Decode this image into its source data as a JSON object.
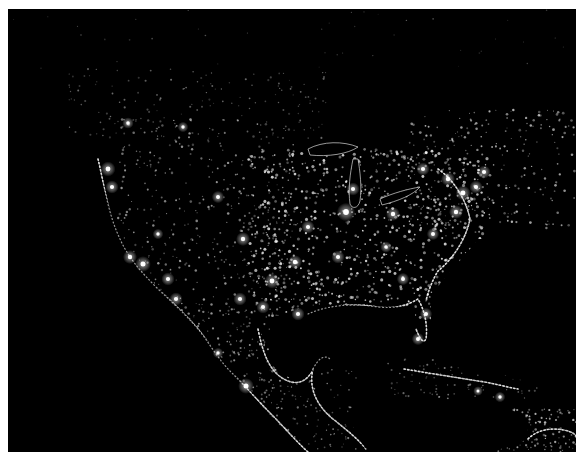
{
  "image": {
    "subject": "North America at night — satellite composite of city lights",
    "alt": "Night-time satellite view of North America showing city lights across the United States, southern Canada, Mexico, Central America and the Caribbean",
    "colors": {
      "background": "#000000",
      "frame": "#ffffff",
      "light": "#f4f4f4",
      "glow": "#bdbdbd"
    }
  },
  "scene": {
    "bright_cities": [
      {
        "x": 338,
        "y": 203,
        "r": 4.2
      },
      {
        "x": 345,
        "y": 180,
        "r": 3.0
      },
      {
        "x": 385,
        "y": 205,
        "r": 3.2
      },
      {
        "x": 300,
        "y": 218,
        "r": 3.0
      },
      {
        "x": 330,
        "y": 248,
        "r": 3.0
      },
      {
        "x": 287,
        "y": 253,
        "r": 3.2
      },
      {
        "x": 264,
        "y": 272,
        "r": 3.4
      },
      {
        "x": 290,
        "y": 305,
        "r": 3.0
      },
      {
        "x": 255,
        "y": 298,
        "r": 3.0
      },
      {
        "x": 232,
        "y": 290,
        "r": 3.0
      },
      {
        "x": 235,
        "y": 230,
        "r": 3.2
      },
      {
        "x": 210,
        "y": 188,
        "r": 2.8
      },
      {
        "x": 415,
        "y": 160,
        "r": 3.0
      },
      {
        "x": 440,
        "y": 170,
        "r": 3.2
      },
      {
        "x": 455,
        "y": 184,
        "r": 3.4
      },
      {
        "x": 448,
        "y": 203,
        "r": 3.2
      },
      {
        "x": 468,
        "y": 178,
        "r": 3.0
      },
      {
        "x": 476,
        "y": 163,
        "r": 3.0
      },
      {
        "x": 425,
        "y": 225,
        "r": 2.8
      },
      {
        "x": 378,
        "y": 238,
        "r": 2.6
      },
      {
        "x": 395,
        "y": 270,
        "r": 2.8
      },
      {
        "x": 150,
        "y": 225,
        "r": 2.4
      },
      {
        "x": 122,
        "y": 248,
        "r": 3.2
      },
      {
        "x": 135,
        "y": 255,
        "r": 3.6
      },
      {
        "x": 160,
        "y": 270,
        "r": 3.0
      },
      {
        "x": 168,
        "y": 290,
        "r": 3.0
      },
      {
        "x": 100,
        "y": 160,
        "r": 3.4
      },
      {
        "x": 104,
        "y": 178,
        "r": 3.0
      },
      {
        "x": 120,
        "y": 114,
        "r": 2.6
      },
      {
        "x": 175,
        "y": 118,
        "r": 2.4
      },
      {
        "x": 238,
        "y": 377,
        "r": 3.6
      },
      {
        "x": 210,
        "y": 344,
        "r": 2.4
      },
      {
        "x": 418,
        "y": 305,
        "r": 2.8
      },
      {
        "x": 410,
        "y": 330,
        "r": 2.8
      },
      {
        "x": 470,
        "y": 382,
        "r": 2.2
      },
      {
        "x": 492,
        "y": 388,
        "r": 2.4
      }
    ],
    "coast_paths": [
      "M 90 150 C 96 175, 100 205, 112 230 C 120 248, 132 262, 150 280 C 166 295, 176 304, 190 320 C 200 332, 210 350, 222 362 C 236 376, 250 392, 268 410 C 282 425, 292 436, 300 443",
      "M 300 305 C 320 296, 345 294, 370 298 C 388 300, 400 296, 410 290 C 416 300, 420 315, 418 330 C 415 335, 412 330, 408 320",
      "M 250 320 C 255 345, 262 365, 280 372 C 290 376, 300 372, 305 360 C 310 350, 316 345, 322 350",
      "M 305 360 C 300 380, 310 398, 325 410 C 340 422, 350 430, 358 440",
      "M 430 160 C 445 170, 458 190, 462 210 C 458 230, 445 250, 430 262 C 425 270, 420 282, 418 292",
      "M 396 360 C 420 364, 445 368, 470 372 C 485 374, 498 378, 510 380",
      "M 520 430 C 530 420, 545 418, 560 422 C 566 424, 568 426, 568 428"
    ],
    "lakes": [
      {
        "type": "michigan",
        "d": "M 345 150 C 342 165, 340 180, 342 195 C 344 200, 350 200, 352 192 C 354 178, 352 162, 350 150 Z"
      },
      {
        "type": "superior",
        "d": "M 300 140 C 315 132, 335 132, 350 138 C 340 145, 320 148, 302 146 Z"
      },
      {
        "type": "erie",
        "d": "M 372 190 C 385 184, 400 180, 412 178 C 405 186, 390 192, 374 196 Z"
      }
    ],
    "density_regions": [
      {
        "x": 240,
        "y": 140,
        "w": 240,
        "h": 170,
        "count": 900,
        "min": 0.6,
        "max": 1.6,
        "alpha": 0.8
      },
      {
        "x": 110,
        "y": 110,
        "w": 180,
        "h": 200,
        "count": 420,
        "min": 0.5,
        "max": 1.3,
        "alpha": 0.6
      },
      {
        "x": 60,
        "y": 60,
        "w": 260,
        "h": 70,
        "count": 160,
        "min": 0.5,
        "max": 1.1,
        "alpha": 0.45
      },
      {
        "x": 400,
        "y": 100,
        "w": 168,
        "h": 120,
        "count": 260,
        "min": 0.5,
        "max": 1.4,
        "alpha": 0.7
      },
      {
        "x": 170,
        "y": 300,
        "w": 120,
        "h": 100,
        "count": 220,
        "min": 0.5,
        "max": 1.2,
        "alpha": 0.6
      },
      {
        "x": 250,
        "y": 360,
        "w": 100,
        "h": 80,
        "count": 120,
        "min": 0.5,
        "max": 1.1,
        "alpha": 0.55
      },
      {
        "x": 380,
        "y": 350,
        "w": 150,
        "h": 40,
        "count": 90,
        "min": 0.5,
        "max": 1.1,
        "alpha": 0.5
      },
      {
        "x": 490,
        "y": 400,
        "w": 78,
        "h": 43,
        "count": 120,
        "min": 0.5,
        "max": 1.3,
        "alpha": 0.7
      },
      {
        "x": 0,
        "y": 0,
        "w": 568,
        "h": 60,
        "count": 40,
        "min": 0.4,
        "max": 0.9,
        "alpha": 0.35
      }
    ],
    "water_masks": [
      {
        "name": "pacific",
        "d": "M 0 150 L 88 150 C 96 180, 104 210, 116 234 C 130 258, 150 280, 176 304 C 200 330, 222 362, 260 404 C 275 420, 290 435, 298 443 L 0 443 Z"
      },
      {
        "name": "gulf-of-mexico",
        "d": "M 262 318 C 275 300, 300 296, 330 296 C 360 296, 388 300, 406 296 C 410 315, 404 330, 392 335 C 370 340, 345 345, 325 350 C 310 355, 300 368, 290 372 C 275 370, 262 350, 262 318 Z"
      },
      {
        "name": "atlantic",
        "d": "M 568 230 L 470 230 C 455 250, 438 265, 425 285 C 420 300, 424 330, 430 350 C 450 355, 480 360, 510 370 C 540 378, 560 392, 568 400 Z"
      },
      {
        "name": "caribbean",
        "d": "M 340 400 C 370 390, 420 388, 470 392 C 500 395, 520 405, 520 425 C 510 440, 480 443, 440 443 L 360 443 C 350 430, 342 415, 340 400 Z"
      }
    ]
  }
}
